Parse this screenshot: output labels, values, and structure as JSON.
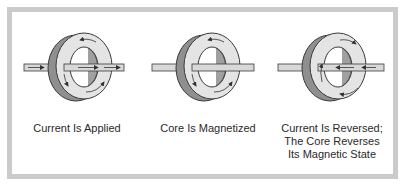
{
  "diagram": {
    "panels": [
      {
        "id": "applied",
        "caption_lines": [
          "Current Is Applied"
        ],
        "wire_arrows": "right",
        "core_arrows": "clockwise"
      },
      {
        "id": "magnetized",
        "caption_lines": [
          "Core Is Magnetized"
        ],
        "wire_arrows": "none",
        "core_arrows": "clockwise"
      },
      {
        "id": "reversed",
        "caption_lines": [
          "Current Is Reversed;",
          "The Core Reverses",
          "Its Magnetic State"
        ],
        "wire_arrows": "left",
        "core_arrows": "counterclockwise"
      }
    ],
    "colors": {
      "frame": "#cbcbcb",
      "core_face": "#e4e4e4",
      "core_side": "#8f8f8f",
      "core_outline": "#3a3a3a",
      "wire": "#d8d8d8",
      "text": "#2a2a2a"
    }
  }
}
